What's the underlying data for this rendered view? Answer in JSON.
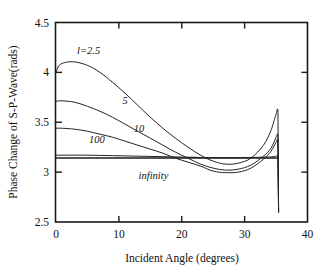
{
  "chart_data": {
    "type": "line",
    "title": "",
    "xlabel": "Incident Angle (degrees)",
    "ylabel": "Phase Change of S-P-Wave(rads)",
    "xlim": [
      0,
      40
    ],
    "ylim": [
      2.5,
      4.5
    ],
    "xticks": [
      0,
      10,
      20,
      30,
      40
    ],
    "yticks": [
      2.5,
      3,
      3.5,
      4,
      4.5
    ],
    "xticklabels": [
      "0",
      "10",
      "20",
      "30",
      "40"
    ],
    "yticklabels": [
      "2.5",
      "3",
      "3.5",
      "4",
      "4.5"
    ],
    "grid": false,
    "legend": "inline-curve-labels",
    "annotations": [
      {
        "text": "l=2.5",
        "x": 5.2,
        "y": 4.18
      },
      {
        "text": "5",
        "x": 11.0,
        "y": 3.68
      },
      {
        "text": "10",
        "x": 13.2,
        "y": 3.4
      },
      {
        "text": "100",
        "x": 6.5,
        "y": 3.29
      },
      {
        "text": "infinity",
        "x": 15.5,
        "y": 2.93
      }
    ],
    "series": [
      {
        "name": "l=2.5",
        "x": [
          0,
          0.5,
          1.5,
          3,
          5,
          7,
          9,
          11,
          13,
          15,
          17,
          19,
          21,
          23,
          25,
          27,
          29,
          31,
          33,
          34.2,
          35,
          35.3,
          35.35,
          35.4
        ],
        "y": [
          4.0,
          4.07,
          4.1,
          4.105,
          4.07,
          4.0,
          3.9,
          3.79,
          3.67,
          3.55,
          3.44,
          3.34,
          3.25,
          3.17,
          3.11,
          3.08,
          3.09,
          3.14,
          3.27,
          3.42,
          3.58,
          3.6,
          3.14,
          2.6
        ]
      },
      {
        "name": "5",
        "x": [
          0,
          1,
          3,
          5,
          7,
          9,
          11,
          13,
          15,
          17,
          19,
          21,
          23,
          25,
          27,
          29,
          31,
          33,
          34.2,
          35,
          35.3,
          35.35,
          35.4
        ],
        "y": [
          3.71,
          3.715,
          3.7,
          3.66,
          3.61,
          3.55,
          3.48,
          3.41,
          3.34,
          3.27,
          3.2,
          3.14,
          3.08,
          3.04,
          3.02,
          3.03,
          3.07,
          3.16,
          3.24,
          3.35,
          3.37,
          3.14,
          2.6
        ]
      },
      {
        "name": "10",
        "x": [
          0,
          1,
          3,
          5,
          7,
          9,
          11,
          13,
          15,
          17,
          19,
          21,
          23,
          25,
          27,
          29,
          31,
          33,
          34.2,
          35,
          35.25,
          35.3,
          35.4
        ],
        "y": [
          3.44,
          3.44,
          3.43,
          3.41,
          3.38,
          3.35,
          3.31,
          3.27,
          3.23,
          3.19,
          3.14,
          3.1,
          3.06,
          3.01,
          2.995,
          3.0,
          3.04,
          3.13,
          3.21,
          3.3,
          3.32,
          3.14,
          2.6
        ]
      },
      {
        "name": "100",
        "x": [
          0,
          2,
          5,
          9,
          13,
          17,
          21,
          25,
          29,
          33,
          34.5,
          35,
          35.25,
          35.3,
          35.4
        ],
        "y": [
          3.17,
          3.17,
          3.17,
          3.165,
          3.16,
          3.155,
          3.15,
          3.145,
          3.145,
          3.15,
          3.155,
          3.16,
          3.165,
          3.14,
          2.6
        ]
      },
      {
        "name": "infinity",
        "x": [
          0,
          10,
          20,
          30,
          35.3,
          35.4
        ],
        "y": [
          3.1416,
          3.1416,
          3.1416,
          3.1416,
          3.1416,
          3.1416
        ]
      }
    ]
  },
  "axes": {
    "x_title": "Incident Angle (degrees)",
    "y_title": "Phase Change of S-P-Wave(rads)"
  }
}
